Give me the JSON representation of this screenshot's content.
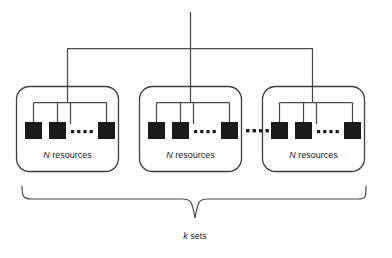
{
  "diagram": {
    "type": "hierarchical-resource-tree",
    "background_color": "#ffffff",
    "line_color": "#4a4a4a",
    "box_fill_color": "#1a1a1a",
    "text_color": "#1a1a1a",
    "groups": [
      {
        "id": "group-1",
        "label_italic": "N",
        "label_rest": " resources",
        "label_full": "N resources",
        "resource_count_visible": 3,
        "ellipsis_dots": 4
      },
      {
        "id": "group-2",
        "label_italic": "N",
        "label_rest": " resources",
        "label_full": "N resources",
        "resource_count_visible": 3,
        "ellipsis_dots": 4
      },
      {
        "id": "group-3",
        "label_italic": "N",
        "label_rest": " resources",
        "label_full": "N resources",
        "resource_count_visible": 3,
        "ellipsis_dots": 4
      }
    ],
    "between_groups_ellipsis": {
      "dots": 4,
      "position": "between-group-2-and-group-3"
    },
    "brace": {
      "label_italic": "k",
      "label_rest": " sets",
      "label_full": "k sets",
      "orientation": "bottom"
    }
  }
}
